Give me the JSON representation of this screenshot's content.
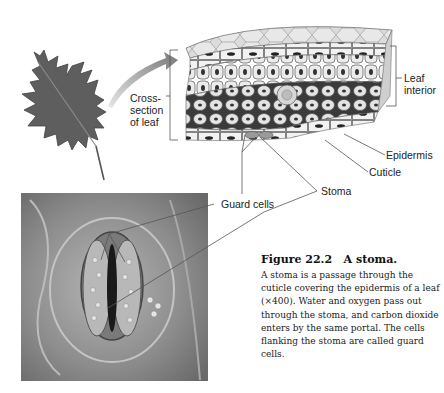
{
  "figure": {
    "number": "Figure 22.2",
    "title": "A stoma.",
    "caption": "A stoma is a passage through the cuticle covering the epidermis of a leaf (×400). Water and oxygen pass out through the stoma, and carbon dioxide enters by the same portal. The cells flanking the stoma are called guard cells."
  },
  "labels": {
    "cross_section_line1": "Cross-",
    "cross_section_line2": "section",
    "cross_section_line3": "of leaf",
    "leaf_interior_line1": "Leaf",
    "leaf_interior_line2": "interior",
    "epidermis": "Epidermis",
    "cuticle": "Cuticle",
    "stoma": "Stoma",
    "guard_cells": "Guard cells"
  },
  "images": {
    "leaf": "oak-leaf-illustration",
    "cross_section": "leaf-cross-section-illustration",
    "micrograph": "stoma-micrograph"
  },
  "colors": {
    "leaf": "#5a5a5a",
    "cell_fill": "#e8e8e8",
    "cell_stroke": "#6a6a6a",
    "micrograph_bg": "#8a8a8a",
    "arrow": "#9a9a9a"
  }
}
